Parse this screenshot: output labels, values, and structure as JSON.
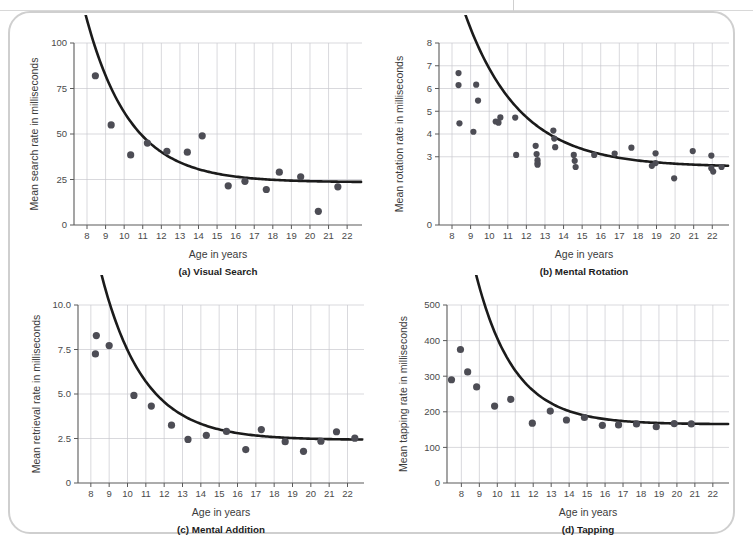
{
  "figure": {
    "panel_count": 4,
    "colors": {
      "point": "#4d4d55",
      "curve": "#1b1b1b",
      "grid": "#c9c9cf",
      "axis": "#5a5a5a",
      "card_border": "#cfcfcf",
      "background": "#ffffff"
    }
  },
  "chart_data": [
    {
      "id": "a",
      "type": "scatter",
      "title": "(a) Visual Search",
      "xlabel": "Age in years",
      "ylabel": "Mean search rate in milliseconds",
      "xlim": [
        7.3,
        22.8
      ],
      "ylim": [
        0,
        100
      ],
      "xticks": [
        8,
        9,
        10,
        11,
        12,
        13,
        14,
        15,
        16,
        17,
        18,
        19,
        20,
        21,
        22
      ],
      "yticks": [
        0,
        25,
        50,
        75,
        100
      ],
      "ytick_labels": [
        "0",
        "25",
        "50",
        "75",
        "100"
      ],
      "grid": "vertical-and-horizontal",
      "legend": "none",
      "x": [
        8.45,
        9.3,
        10.35,
        11.25,
        12.3,
        13.4,
        14.2,
        15.6,
        16.5,
        17.65,
        18.35,
        19.5,
        20.45,
        21.5
      ],
      "y": [
        82,
        55,
        38.5,
        45,
        40.5,
        40,
        49,
        21.5,
        24,
        19.5,
        29,
        26.5,
        7.5,
        21
      ],
      "fit_curve": {
        "form": "exponential-decay",
        "asymptote": 23.5,
        "amplitude": 95,
        "rate": 0.42,
        "x_start": 7.85,
        "x_end": 22.75
      }
    },
    {
      "id": "b",
      "type": "scatter",
      "title": "(b) Mental Rotation",
      "xlabel": "Age in years",
      "ylabel": "Mean rotation rate in milliseconds",
      "xlim": [
        7.3,
        22.9
      ],
      "ylim": [
        0,
        8
      ],
      "xticks": [
        8,
        9,
        10,
        11,
        12,
        13,
        14,
        15,
        16,
        17,
        18,
        19,
        20,
        21,
        22
      ],
      "yticks": [
        0,
        3,
        4,
        5,
        6,
        7,
        8
      ],
      "ytick_labels": [
        "0",
        "3",
        "4",
        "5",
        "6",
        "7",
        "8"
      ],
      "grid": "vertical-and-horizontal",
      "legend": "none",
      "x": [
        8.35,
        8.35,
        8.4,
        9.15,
        9.3,
        9.4,
        10.35,
        10.5,
        10.6,
        11.4,
        11.45,
        12.5,
        12.55,
        12.6,
        12.6,
        12.6,
        13.45,
        13.5,
        13.55,
        14.55,
        14.6,
        14.65,
        15.65,
        16.75,
        17.65,
        18.75,
        18.95,
        18.95,
        19.95,
        20.95,
        21.95,
        21.95,
        22.05,
        22.5
      ],
      "y": [
        6.68,
        6.15,
        4.47,
        4.1,
        6.17,
        5.47,
        4.55,
        4.5,
        4.73,
        4.72,
        3.08,
        3.48,
        3.12,
        2.85,
        2.72,
        2.65,
        4.15,
        3.8,
        3.42,
        3.08,
        2.82,
        2.55,
        3.08,
        3.14,
        3.4,
        2.6,
        3.15,
        2.72,
        2.05,
        3.25,
        3.05,
        2.5,
        2.35,
        2.55
      ],
      "fit_curve": {
        "form": "exponential-decay",
        "asymptote": 2.55,
        "amplitude": 9.0,
        "rate": 0.34,
        "x_start": 7.85,
        "x_end": 22.85
      }
    },
    {
      "id": "c",
      "type": "scatter",
      "title": "(c) Mental Addition",
      "xlabel": "Age in years",
      "ylabel": "Mean retrieval rate in milliseconds",
      "xlim": [
        7.3,
        22.9
      ],
      "ylim": [
        0,
        10
      ],
      "xticks": [
        8,
        9,
        10,
        11,
        12,
        13,
        14,
        15,
        16,
        17,
        18,
        19,
        20,
        21,
        22
      ],
      "yticks": [
        0,
        2.5,
        5.0,
        7.5,
        10.0
      ],
      "ytick_labels": [
        "0",
        "2.5",
        "5.0",
        "7.5",
        "10.0"
      ],
      "grid": "vertical-and-horizontal",
      "legend": "none",
      "x": [
        8.3,
        8.25,
        9.0,
        10.35,
        11.3,
        12.4,
        13.3,
        14.3,
        15.4,
        16.45,
        17.3,
        18.6,
        19.6,
        20.55,
        21.4,
        22.4
      ],
      "y": [
        8.28,
        7.25,
        7.72,
        4.92,
        4.32,
        3.25,
        2.45,
        2.68,
        2.9,
        1.88,
        3.0,
        2.32,
        1.78,
        2.35,
        2.88,
        2.52
      ],
      "fit_curve": {
        "form": "exponential-decay",
        "asymptote": 2.42,
        "amplitude": 13.0,
        "rate": 0.43,
        "x_start": 7.8,
        "x_end": 22.8
      }
    },
    {
      "id": "d",
      "type": "scatter",
      "title": "(d) Tapping",
      "xlabel": "Age in years",
      "ylabel": "Mean tapping rate in milliseconds",
      "xlim": [
        7.2,
        22.9
      ],
      "ylim": [
        0,
        500
      ],
      "xticks": [
        8,
        9,
        10,
        11,
        12,
        13,
        14,
        15,
        16,
        17,
        18,
        19,
        20,
        21,
        22
      ],
      "yticks": [
        0,
        100,
        200,
        300,
        400,
        500
      ],
      "ytick_labels": [
        "0",
        "100",
        "200",
        "300",
        "400",
        "500"
      ],
      "grid": "vertical-and-horizontal",
      "legend": "none",
      "x": [
        7.45,
        7.95,
        8.35,
        8.85,
        9.85,
        10.75,
        11.95,
        12.95,
        13.85,
        14.85,
        15.85,
        16.75,
        17.75,
        18.85,
        19.85,
        20.8
      ],
      "y": [
        290,
        375,
        312,
        270,
        216,
        235,
        168,
        202,
        177,
        184,
        162,
        163,
        166,
        158,
        167,
        166
      ],
      "fit_curve": {
        "form": "exponential-decay",
        "asymptote": 165,
        "amplitude": 900,
        "rate": 0.47,
        "x_start": 7.2,
        "x_end": 22.85
      }
    }
  ]
}
